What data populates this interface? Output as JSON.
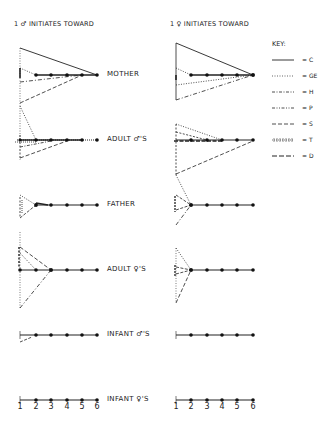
{
  "headers": {
    "left": "1 ♂ INITIATES TOWARD",
    "right": "1 ♀ INITIATES TOWARD"
  },
  "rows": [
    {
      "label": "MOTHER"
    },
    {
      "label": "ADULT ♂'S"
    },
    {
      "label": "FATHER"
    },
    {
      "label": "ADULT ♀'S"
    },
    {
      "label": "INFANT ♂'S"
    },
    {
      "label": "INFANT ♀'S"
    }
  ],
  "x_ticks": [
    "1",
    "2",
    "3",
    "4",
    "5",
    "6"
  ],
  "key": {
    "title": "KEY:",
    "items": [
      {
        "code": "= C",
        "style": "solid"
      },
      {
        "code": "= GE",
        "style": "dotted"
      },
      {
        "code": "= H",
        "style": "dash-dot"
      },
      {
        "code": "= P",
        "style": "dash-dot-dot"
      },
      {
        "code": "= S",
        "style": "dashed"
      },
      {
        "code": "= T",
        "style": "hatched"
      },
      {
        "code": "= D",
        "style": "long-dash"
      }
    ]
  },
  "colors": {
    "ink": "#222222",
    "background": "#ffffff"
  }
}
